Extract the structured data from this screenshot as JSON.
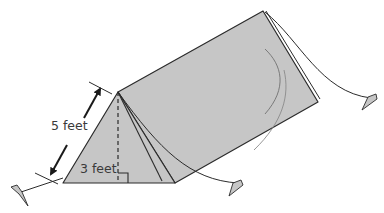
{
  "figure": {
    "colors": {
      "fill": "#c6c6c6",
      "stroke": "#2b2b2b",
      "background": "#ffffff"
    },
    "labels": {
      "slant_height": "5 feet",
      "height": "3 feet"
    },
    "annotations": {
      "right_angle_marker": true,
      "dimension_arrow": "double-headed arrow along front slant edge",
      "height_line": "dashed vertical line from apex to base"
    }
  }
}
